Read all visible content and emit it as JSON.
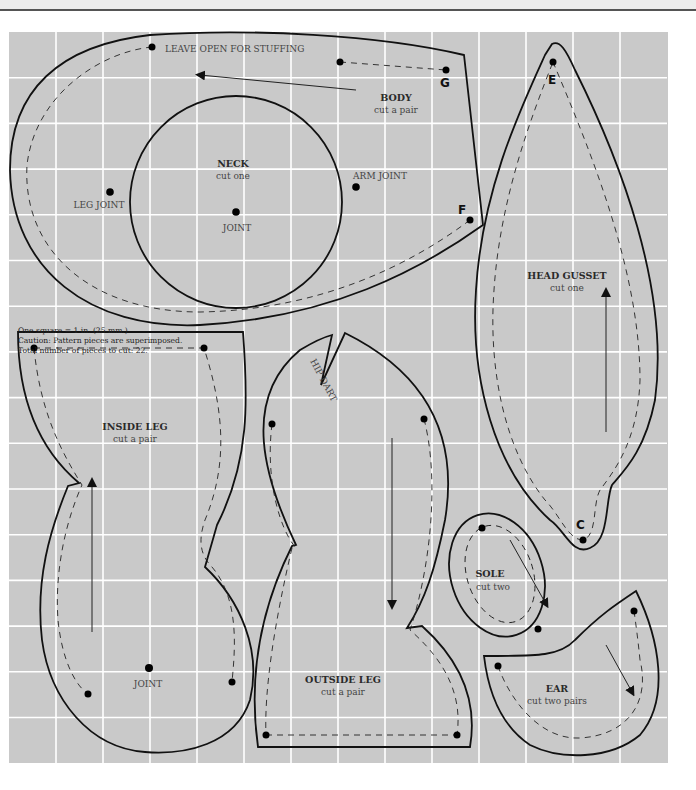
{
  "pattern": {
    "grid": {
      "x0": 9,
      "y0": 32,
      "cols": 14,
      "rows": 16,
      "cell_w": 47,
      "cell_h": 45.7,
      "background": "#c9c9c9",
      "line_color": "#ffffff"
    },
    "notes": {
      "scale": "One square = 1 in. (25 mm.)",
      "caution": "Caution: Pattern pieces are superimposed.",
      "total": "Total number of pieces to cut: 22."
    },
    "pieces": {
      "body": {
        "title": "BODY",
        "subtitle": "cut a pair",
        "open_label": "LEAVE OPEN FOR STUFFING",
        "leg_joint": "LEG JOINT",
        "arm_joint": "ARM JOINT",
        "point_g": "G",
        "point_f": "F"
      },
      "neck": {
        "title": "NECK",
        "subtitle": "cut one",
        "joint": "JOINT"
      },
      "head_gusset": {
        "title": "HEAD GUSSET",
        "subtitle": "cut one",
        "point_e": "E",
        "point_c": "C"
      },
      "inside_leg": {
        "title": "INSIDE LEG",
        "subtitle": "cut a pair",
        "joint": "JOINT"
      },
      "outside_leg": {
        "title": "OUTSIDE LEG",
        "subtitle": "cut a pair",
        "hip_dart": "HIP DART"
      },
      "sole": {
        "title": "SOLE",
        "subtitle": "cut two"
      },
      "ear": {
        "title": "EAR",
        "subtitle": "cut two pairs"
      }
    }
  }
}
